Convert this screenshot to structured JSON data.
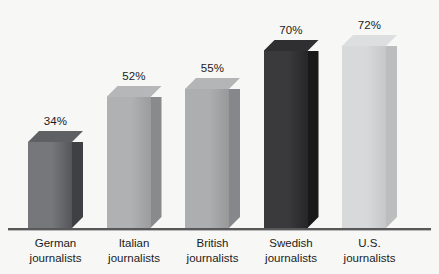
{
  "chart_data": {
    "type": "bar",
    "title": "",
    "subtitle": "",
    "xlabel": "",
    "ylabel": "",
    "ylim": [
      0,
      80
    ],
    "grid": false,
    "legend": "none",
    "categories": [
      "German journalists",
      "Italian journalists",
      "British journalists",
      "Swedish journalists",
      "U.S. journalists"
    ],
    "values": [
      34,
      52,
      55,
      70,
      72
    ],
    "value_labels": [
      "34%",
      "52%",
      "55%",
      "70%",
      "72%"
    ],
    "series": [
      {
        "name": "",
        "values": [
          34,
          52,
          55,
          70,
          72
        ]
      }
    ],
    "annotations": [],
    "style": "3d-bar",
    "bar_colors": [
      "#6f7073",
      "#a8a9ab",
      "#a4a5a7",
      "#2e2e30",
      "#d3d4d5"
    ]
  },
  "axis": {
    "baseline_color": "#58585a"
  },
  "bars": [
    {
      "label_line1": "German",
      "label_line2": "journalists",
      "value_label": "34%",
      "value": 34,
      "front_color_left": "#76777a",
      "front_color_right": "#55565a",
      "top_color": "#5f6063",
      "side_color": "#3f4043"
    },
    {
      "label_line1": "Italian",
      "label_line2": "journalists",
      "value_label": "52%",
      "value": 52,
      "front_color_left": "#b0b1b3",
      "front_color_right": "#9b9c9e",
      "top_color": "#b6b7b9",
      "side_color": "#898a8c"
    },
    {
      "label_line1": "British",
      "label_line2": "journalists",
      "value_label": "55%",
      "value": 55,
      "front_color_left": "#adaeb0",
      "front_color_right": "#97989a",
      "top_color": "#b4b5b7",
      "side_color": "#86878a"
    },
    {
      "label_line1": "Swedish",
      "label_line2": "journalists",
      "value_label": "70%",
      "value": 70,
      "front_color_left": "#3a3a3c",
      "front_color_right": "#262628",
      "top_color": "#2f2f31",
      "side_color": "#191919"
    },
    {
      "label_line1": "U.S.",
      "label_line2": "journalists",
      "value_label": "72%",
      "value": 72,
      "front_color_left": "#d8d9da",
      "front_color_right": "#c6c7c8",
      "top_color": "#dddedf",
      "side_color": "#bcbdbe"
    }
  ],
  "background": {
    "color": "#f7f7f5"
  }
}
